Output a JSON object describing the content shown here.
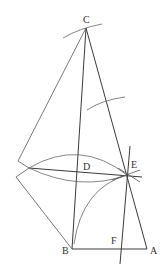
{
  "diagram": {
    "type": "geometric-construction",
    "background": "#ffffff",
    "line_color": "#3a3a3a",
    "points": {
      "C": {
        "label": "C",
        "x": 86,
        "y": 28
      },
      "A": {
        "label": "A",
        "x": 147,
        "y": 249
      },
      "B": {
        "label": "B",
        "x": 72,
        "y": 249
      },
      "D": {
        "label": "D",
        "x": 78,
        "y": 168
      },
      "E": {
        "label": "E",
        "x": 127,
        "y": 175
      },
      "F": {
        "label": "F",
        "x": 122,
        "y": 249
      }
    },
    "labels": {
      "C": "C",
      "D": "D",
      "E": "E",
      "B": "B",
      "F": "F",
      "A": "A"
    }
  }
}
